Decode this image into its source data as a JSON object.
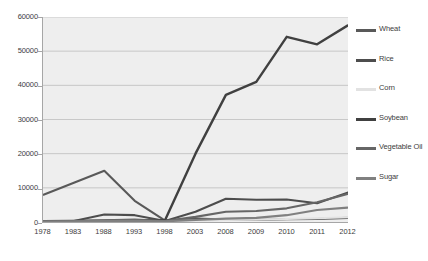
{
  "chart_data": {
    "type": "line",
    "title": "",
    "xlabel": "",
    "ylabel": "",
    "categories": [
      "1978",
      "1983",
      "1988",
      "1993",
      "1998",
      "2003",
      "2008",
      "2009",
      "2010",
      "2011",
      "2012"
    ],
    "ylim": [
      0,
      60000
    ],
    "yticks": [
      0,
      10000,
      20000,
      30000,
      40000,
      50000,
      60000
    ],
    "ytick_labels": [
      "0",
      "10000",
      "20000",
      "30000",
      "40000",
      "50000",
      "60000"
    ],
    "grid": true,
    "legend_position": "right",
    "plot_background": "#eeeeee",
    "series": [
      {
        "name": "Wheat",
        "color": "#595959",
        "values": [
          8000,
          11500,
          15000,
          6200,
          400,
          1000,
          700,
          600,
          800,
          900,
          1200
        ]
      },
      {
        "name": "Rice",
        "color": "#4d4d4d",
        "values": [
          300,
          300,
          2200,
          2000,
          300,
          3000,
          6800,
          6500,
          6600,
          5500,
          8600
        ]
      },
      {
        "name": "Corn",
        "color": "#e2e2e2",
        "values": [
          100,
          150,
          200,
          300,
          200,
          400,
          600,
          700,
          900,
          1100,
          1400
        ]
      },
      {
        "name": "Soybean",
        "color": "#404040",
        "values": [
          200,
          300,
          400,
          500,
          600,
          20000,
          37200,
          41000,
          54200,
          52000,
          57500
        ]
      },
      {
        "name": "Vegetable Oil",
        "color": "#666666",
        "values": [
          200,
          250,
          500,
          700,
          300,
          1500,
          3000,
          3200,
          4000,
          5800,
          8200
        ]
      },
      {
        "name": "Sugar",
        "color": "#808080",
        "values": [
          150,
          200,
          250,
          350,
          200,
          600,
          1000,
          1200,
          2000,
          3500,
          4200
        ]
      }
    ]
  },
  "legend": {
    "items": [
      {
        "label": "Wheat",
        "color": "#595959"
      },
      {
        "label": "Rice",
        "color": "#4d4d4d"
      },
      {
        "label": "Corn",
        "color": "#e2e2e2"
      },
      {
        "label": "Soybean",
        "color": "#404040"
      },
      {
        "label": "Vegetable Oil",
        "color": "#666666"
      },
      {
        "label": "Sugar",
        "color": "#808080"
      }
    ]
  }
}
